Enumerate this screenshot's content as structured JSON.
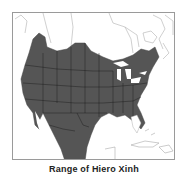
{
  "map": {
    "title": "Range of the species",
    "region": "North America",
    "range_color": "#555555",
    "border_color": "#1a1a1a",
    "outline_color": "#9a9a9a"
  },
  "caption": "Range of Hiero Xinh"
}
